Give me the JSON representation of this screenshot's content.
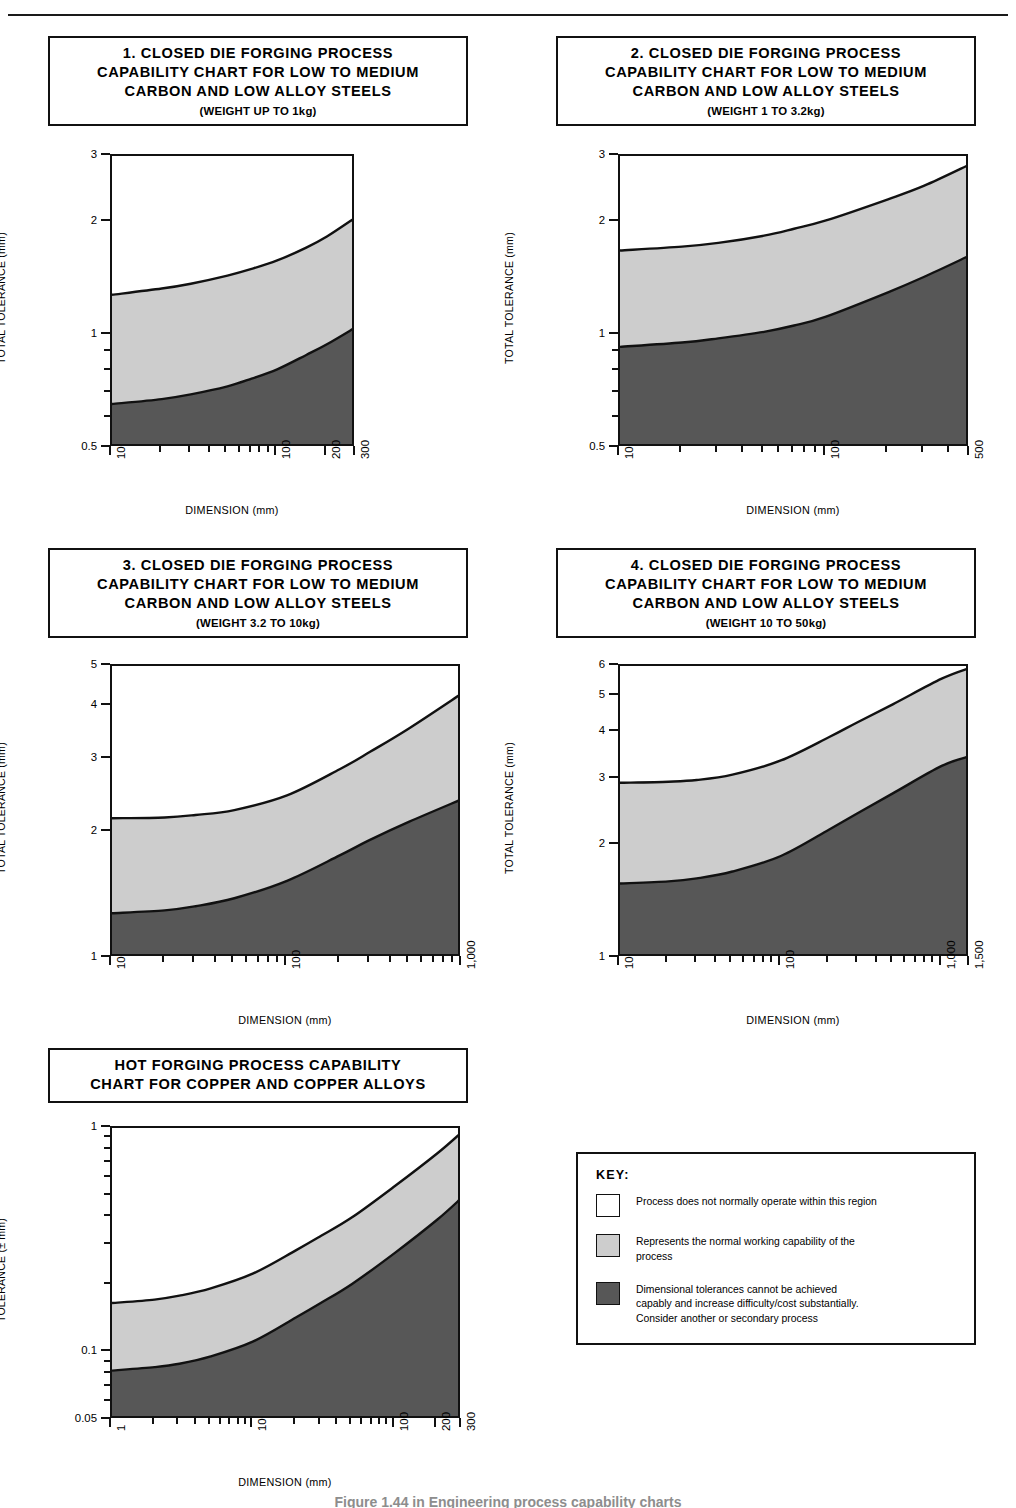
{
  "page": {
    "caption": "Figure 1.44 in Engineering process capability charts"
  },
  "colors": {
    "region_none": "#ffffff",
    "region_normal": "#cdcdcd",
    "region_difficult": "#575757",
    "line": "#111111"
  },
  "charts": [
    {
      "id": "chart-1",
      "title": "1. CLOSED DIE FORGING PROCESS\nCAPABILITY CHART FOR LOW TO MEDIUM\nCARBON AND LOW ALLOY STEELS",
      "subtitle": "(WEIGHT UP TO 1kg)",
      "chart_data": {
        "type": "area",
        "title": "1. CLOSED DIE FORGING PROCESS CAPABILITY CHART FOR LOW TO MEDIUM CARBON AND LOW ALLOY STEELS (WEIGHT UP TO 1kg)",
        "xlabel": "DIMENSION (mm)",
        "ylabel": "TOTAL TOLERANCE (mm)",
        "xscale": "log",
        "yscale": "log",
        "xlim": [
          10,
          300
        ],
        "ylim": [
          0.5,
          3
        ],
        "xticks": [
          10,
          100,
          200,
          300
        ],
        "xticklabels": [
          "10",
          "100",
          "200",
          "300"
        ],
        "yticks": [
          0.5,
          0.6,
          0.7,
          0.8,
          0.9,
          1,
          2,
          3
        ],
        "yticklabels": [
          "0.5",
          "",
          "",
          "",
          "",
          "1",
          "2",
          "3"
        ],
        "grid": false,
        "legend": "external-key",
        "x": [
          10,
          20,
          30,
          50,
          70,
          100,
          150,
          200,
          300
        ],
        "series": [
          {
            "name": "upper boundary of normal working capability",
            "values": [
              1.28,
              1.33,
              1.37,
              1.44,
              1.5,
              1.58,
              1.71,
              1.83,
              2.06
            ]
          },
          {
            "name": "lower boundary of normal working capability",
            "values": [
              0.655,
              0.675,
              0.695,
              0.73,
              0.765,
              0.81,
              0.885,
              0.945,
              1.05
            ]
          }
        ]
      }
    },
    {
      "id": "chart-2",
      "title": "2. CLOSED DIE FORGING PROCESS\nCAPABILITY CHART FOR LOW TO MEDIUM\nCARBON AND LOW ALLOY STEELS",
      "subtitle": "(WEIGHT 1 TO 3.2kg)",
      "chart_data": {
        "type": "area",
        "title": "2. CLOSED DIE FORGING PROCESS CAPABILITY CHART FOR LOW TO MEDIUM CARBON AND LOW ALLOY STEELS (WEIGHT 1 TO 3.2kg)",
        "xlabel": "DIMENSION (mm)",
        "ylabel": "TOTAL TOLERANCE (mm)",
        "xscale": "log",
        "yscale": "log",
        "xlim": [
          10,
          500
        ],
        "ylim": [
          0.5,
          3
        ],
        "xticks": [
          10,
          100,
          500
        ],
        "xticklabels": [
          "10",
          "100",
          "500"
        ],
        "yticks": [
          0.5,
          0.6,
          0.7,
          0.8,
          0.9,
          1,
          2,
          3
        ],
        "yticklabels": [
          "0.5",
          "",
          "",
          "",
          "",
          "1",
          "2",
          "3"
        ],
        "grid": false,
        "legend": "external-key",
        "x": [
          10,
          20,
          30,
          50,
          70,
          100,
          200,
          300,
          500
        ],
        "series": [
          {
            "name": "upper boundary of normal working capability",
            "values": [
              1.68,
              1.72,
              1.76,
              1.84,
              1.92,
              2.02,
              2.3,
              2.5,
              2.85
            ]
          },
          {
            "name": "lower boundary of normal working capability",
            "values": [
              0.93,
              0.955,
              0.98,
              1.02,
              1.06,
              1.12,
              1.3,
              1.43,
              1.63
            ]
          }
        ]
      }
    },
    {
      "id": "chart-3",
      "title": "3. CLOSED DIE FORGING PROCESS\nCAPABILITY CHART FOR LOW TO MEDIUM\nCARBON AND LOW ALLOY STEELS",
      "subtitle": "(WEIGHT 3.2 TO 10kg)",
      "chart_data": {
        "type": "area",
        "title": "3. CLOSED DIE FORGING PROCESS CAPABILITY CHART FOR LOW TO MEDIUM CARBON AND LOW ALLOY STEELS (WEIGHT 3.2 TO 10kg)",
        "xlabel": "DIMENSION (mm)",
        "ylabel": "TOTAL TOLERANCE (mm)",
        "xscale": "log",
        "yscale": "log",
        "xlim": [
          10,
          1000
        ],
        "ylim": [
          1,
          5
        ],
        "xticks": [
          10,
          100,
          1000
        ],
        "xticklabels": [
          "10",
          "100",
          "1,000"
        ],
        "yticks": [
          1,
          2,
          3,
          4,
          5
        ],
        "yticklabels": [
          "1",
          "2",
          "3",
          "4",
          "5"
        ],
        "grid": false,
        "legend": "external-key",
        "x": [
          10,
          20,
          30,
          50,
          100,
          200,
          300,
          500,
          1000
        ],
        "series": [
          {
            "name": "upper boundary of normal working capability",
            "values": [
              2.16,
              2.17,
              2.2,
              2.26,
              2.45,
              2.83,
              3.12,
              3.55,
              4.3
            ]
          },
          {
            "name": "lower boundary of normal working capability",
            "values": [
              1.28,
              1.3,
              1.33,
              1.39,
              1.53,
              1.76,
              1.92,
              2.12,
              2.4
            ]
          }
        ]
      }
    },
    {
      "id": "chart-4",
      "title": "4. CLOSED DIE FORGING PROCESS\nCAPABILITY CHART FOR LOW TO MEDIUM\nCARBON AND LOW ALLOY STEELS",
      "subtitle": "(WEIGHT 10 TO 50kg)",
      "chart_data": {
        "type": "area",
        "title": "4. CLOSED DIE FORGING PROCESS CAPABILITY CHART FOR LOW TO MEDIUM CARBON AND LOW ALLOY STEELS (WEIGHT 10 TO 50kg)",
        "xlabel": "DIMENSION (mm)",
        "ylabel": "TOTAL TOLERANCE (mm)",
        "xscale": "log",
        "yscale": "log",
        "xlim": [
          10,
          1500
        ],
        "ylim": [
          1,
          6
        ],
        "xticks": [
          10,
          100,
          1000,
          1500
        ],
        "xticklabels": [
          "10",
          "100",
          "1,000",
          "1,500"
        ],
        "yticks": [
          1,
          2,
          3,
          4,
          5,
          6
        ],
        "yticklabels": [
          "1",
          "2",
          "3",
          "4",
          "5",
          "6"
        ],
        "grid": false,
        "legend": "external-key",
        "x": [
          10,
          20,
          30,
          50,
          100,
          200,
          300,
          500,
          1000,
          1500
        ],
        "series": [
          {
            "name": "upper boundary of normal working capability",
            "values": [
              2.93,
              2.95,
              2.98,
              3.08,
              3.36,
              3.88,
              4.25,
              4.75,
              5.55,
              5.93
            ]
          },
          {
            "name": "lower boundary of normal working capability",
            "values": [
              1.58,
              1.6,
              1.63,
              1.7,
              1.87,
              2.2,
              2.43,
              2.75,
              3.25,
              3.45
            ]
          }
        ]
      }
    },
    {
      "id": "chart-5",
      "title": "HOT FORGING PROCESS CAPABILITY\nCHART FOR COPPER AND COPPER ALLOYS",
      "subtitle": "",
      "chart_data": {
        "type": "area",
        "title": "HOT FORGING PROCESS CAPABILITY CHART FOR COPPER AND COPPER ALLOYS",
        "xlabel": "DIMENSION (mm)",
        "ylabel": "TOLERANCE (± mm)",
        "xscale": "log",
        "yscale": "log",
        "xlim": [
          1,
          300
        ],
        "ylim": [
          0.05,
          1
        ],
        "xticks": [
          1,
          10,
          100,
          200,
          300
        ],
        "xticklabels": [
          "1",
          "10",
          "100",
          "200",
          "300"
        ],
        "yticks": [
          0.05,
          0.06,
          0.07,
          0.08,
          0.09,
          0.1,
          0.2,
          0.3,
          0.4,
          0.5,
          0.6,
          0.7,
          0.8,
          0.9,
          1
        ],
        "yticklabels": [
          "0.05",
          "",
          "",
          "",
          "",
          "0.1",
          "",
          "",
          "",
          "",
          "",
          "",
          "",
          "",
          "1"
        ],
        "grid": false,
        "legend": "external-key",
        "x": [
          1,
          2,
          3,
          5,
          10,
          20,
          30,
          50,
          100,
          200,
          300
        ],
        "series": [
          {
            "name": "upper boundary of normal working capability",
            "values": [
              0.166,
              0.172,
              0.179,
              0.193,
              0.225,
              0.285,
              0.33,
              0.4,
              0.55,
              0.77,
              0.96
            ]
          },
          {
            "name": "lower boundary of normal working capability",
            "values": [
              0.083,
              0.086,
              0.089,
              0.096,
              0.112,
              0.143,
              0.166,
              0.202,
              0.277,
              0.39,
              0.49
            ]
          }
        ]
      }
    }
  ],
  "key": {
    "title": "KEY:",
    "items": [
      {
        "swatch": "none",
        "text": "Process does not normally operate within this region"
      },
      {
        "swatch": "normal",
        "text": "Represents the normal working capability of the\nprocess"
      },
      {
        "swatch": "difficult",
        "text": "Dimensional tolerances cannot be achieved\ncapably and increase difficulty/cost substantially.\nConsider another or secondary process"
      }
    ]
  }
}
